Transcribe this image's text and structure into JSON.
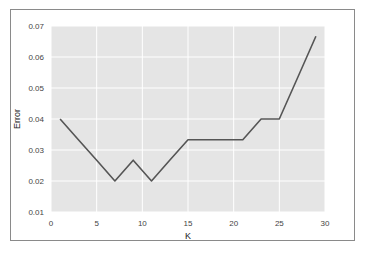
{
  "chart_data": {
    "type": "line",
    "title": "",
    "xlabel": "K",
    "ylabel": "Error",
    "xlim": [
      0,
      30
    ],
    "ylim": [
      0.01,
      0.07
    ],
    "xticks": [
      "0",
      "5",
      "10",
      "15",
      "20",
      "25",
      "30"
    ],
    "yticks": [
      "0.01",
      "0.02",
      "0.03",
      "0.04",
      "0.05",
      "0.06",
      "0.07"
    ],
    "grid": true,
    "legend": null,
    "series": [
      {
        "name": "Error",
        "color": "#555555",
        "x": [
          1,
          3,
          5,
          7,
          9,
          11,
          13,
          15,
          17,
          19,
          21,
          23,
          25,
          27,
          29
        ],
        "y": [
          0.04,
          0.0333,
          0.0267,
          0.02,
          0.0267,
          0.02,
          0.0267,
          0.0333,
          0.0333,
          0.0333,
          0.0333,
          0.04,
          0.04,
          0.0533,
          0.0667
        ]
      }
    ]
  },
  "style": {
    "plot_bg": "#e5e5e5",
    "grid_color": "#ffffff",
    "line_color": "#555555"
  }
}
